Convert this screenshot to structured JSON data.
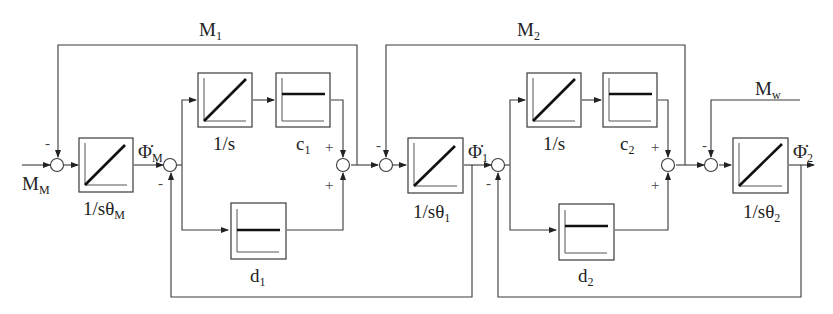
{
  "diagram": {
    "signals": {
      "input_torque": {
        "base": "M",
        "sub": "M"
      },
      "shaft_torque_1": {
        "base": "M",
        "sub": "1"
      },
      "shaft_torque_2": {
        "base": "M",
        "sub": "2"
      },
      "load_torque": {
        "base": "M",
        "sub": "w"
      },
      "speed_motor": {
        "base": "Φ̇",
        "sub": "M"
      },
      "speed_1": {
        "base": "Φ̇",
        "sub": "1"
      },
      "speed_2": {
        "base": "Φ̇",
        "sub": "2"
      }
    },
    "blocks": {
      "inertia_motor": {
        "base": "1/sθ",
        "sub": "M",
        "shape": "ramp"
      },
      "integrator_1": {
        "label": "1/s",
        "shape": "ramp"
      },
      "stiffness_1": {
        "base": "c",
        "sub": "1",
        "shape": "flat"
      },
      "damping_1": {
        "base": "d",
        "sub": "1",
        "shape": "flat"
      },
      "inertia_1": {
        "base": "1/sθ",
        "sub": "1",
        "shape": "ramp"
      },
      "integrator_2": {
        "label": "1/s",
        "shape": "ramp"
      },
      "stiffness_2": {
        "base": "c",
        "sub": "2",
        "shape": "flat"
      },
      "damping_2": {
        "base": "d",
        "sub": "2",
        "shape": "flat"
      },
      "inertia_2": {
        "base": "1/sθ",
        "sub": "2",
        "shape": "ramp"
      }
    },
    "signs": {
      "minus": "-",
      "plus": "+"
    }
  }
}
